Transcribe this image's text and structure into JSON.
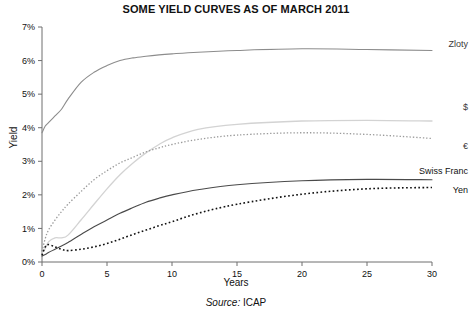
{
  "chart_data": {
    "type": "line",
    "title": "SOME YIELD CURVES AS OF MARCH 2011",
    "xlabel": "Years",
    "ylabel": "Yield",
    "source": "Source: ICAP",
    "source_prefix": "Source:",
    "source_value": "ICAP",
    "xlim": [
      0,
      30
    ],
    "ylim": [
      0,
      7
    ],
    "xticks": [
      0,
      5,
      10,
      15,
      20,
      25,
      30
    ],
    "xtick_labels": [
      "0",
      "5",
      "10",
      "15",
      "20",
      "25",
      "30"
    ],
    "yticks": [
      0,
      1,
      2,
      3,
      4,
      5,
      6,
      7
    ],
    "ytick_labels": [
      "0%",
      "1%",
      "2%",
      "3%",
      "4%",
      "5%",
      "6%",
      "7%"
    ],
    "grid": false,
    "legend_position": "right-of-line-ends",
    "x": [
      0,
      0.25,
      0.5,
      1,
      1.5,
      2,
      3,
      4,
      5,
      6,
      7,
      8,
      9,
      10,
      12,
      15,
      20,
      25,
      30
    ],
    "series": [
      {
        "name": "Zloty",
        "label": "Zloty",
        "color": "#8c8c8c",
        "style": "solid",
        "width": 1.1,
        "label_y": 6.5,
        "values": [
          3.85,
          4.05,
          4.15,
          4.35,
          4.55,
          4.85,
          5.35,
          5.65,
          5.85,
          6.0,
          6.08,
          6.13,
          6.17,
          6.2,
          6.25,
          6.3,
          6.35,
          6.33,
          6.3
        ]
      },
      {
        "name": "$",
        "label": "$",
        "color": "#d3d3d3",
        "style": "solid",
        "width": 1.3,
        "label_y": 4.62,
        "values": [
          0.28,
          0.4,
          0.6,
          0.72,
          0.72,
          0.8,
          1.25,
          1.72,
          2.18,
          2.6,
          2.95,
          3.25,
          3.5,
          3.7,
          3.95,
          4.1,
          4.2,
          4.22,
          4.2
        ]
      },
      {
        "name": "€",
        "label": "€",
        "color": "#9a9a9a",
        "style": "dotted",
        "width": 1.3,
        "label_y": 3.45,
        "values": [
          0.32,
          0.7,
          0.95,
          1.25,
          1.5,
          1.72,
          2.1,
          2.45,
          2.72,
          2.95,
          3.12,
          3.28,
          3.4,
          3.5,
          3.65,
          3.78,
          3.85,
          3.8,
          3.68
        ]
      },
      {
        "name": "Swiss Franc",
        "label": "Swiss Franc",
        "color": "#4a4a4a",
        "style": "solid",
        "width": 1.1,
        "label_y": 2.72,
        "values": [
          0.18,
          0.22,
          0.28,
          0.38,
          0.48,
          0.58,
          0.82,
          1.05,
          1.25,
          1.45,
          1.62,
          1.78,
          1.9,
          2.0,
          2.15,
          2.3,
          2.42,
          2.46,
          2.45
        ]
      },
      {
        "name": "Yen",
        "label": "Yen",
        "color": "#111111",
        "style": "dotted",
        "width": 1.6,
        "label_y": 2.15,
        "values": [
          0.2,
          0.45,
          0.52,
          0.45,
          0.38,
          0.34,
          0.38,
          0.45,
          0.55,
          0.68,
          0.82,
          0.95,
          1.08,
          1.2,
          1.45,
          1.72,
          2.02,
          2.18,
          2.22
        ]
      }
    ]
  },
  "colors": {
    "axis": "#6e6e6e",
    "text": "#111111",
    "background": "#ffffff"
  }
}
